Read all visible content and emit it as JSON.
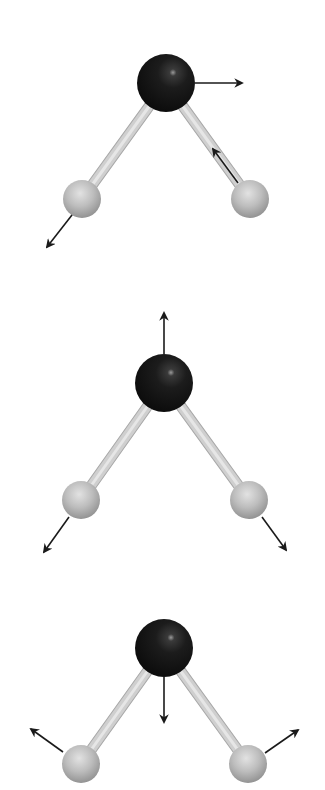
{
  "diagram": {
    "type": "molecular-vibrational-modes",
    "molecule": "bent triatomic (central heavy atom with two light atoms)",
    "colors": {
      "background": "#ffffff",
      "central_atom": "#1a1a1a",
      "outer_atom": "#b4b4b4",
      "bond": "#c8c8c8",
      "arrow": "#1a1a1a"
    },
    "modes": [
      {
        "name": "asymmetric-stretch",
        "central": {
          "cx": 166,
          "cy": 83,
          "r": 29
        },
        "left": {
          "cx": 82,
          "cy": 199,
          "r": 19
        },
        "right": {
          "cx": 250,
          "cy": 199,
          "r": 19
        },
        "arrows": [
          {
            "from": [
              195,
              83
            ],
            "to": [
              242,
              83
            ]
          },
          {
            "from": [
              72,
              215
            ],
            "to": [
              47,
              247
            ]
          },
          {
            "from": [
              238,
              183
            ],
            "to": [
              213,
              149
            ]
          }
        ]
      },
      {
        "name": "symmetric-stretch",
        "central": {
          "cx": 164,
          "cy": 383,
          "r": 29
        },
        "left": {
          "cx": 81,
          "cy": 500,
          "r": 19
        },
        "right": {
          "cx": 249,
          "cy": 500,
          "r": 19
        },
        "arrows": [
          {
            "from": [
              164,
              354
            ],
            "to": [
              164,
              313
            ]
          },
          {
            "from": [
              69,
              517
            ],
            "to": [
              44,
              552
            ]
          },
          {
            "from": [
              262,
              517
            ],
            "to": [
              286,
              550
            ]
          }
        ]
      },
      {
        "name": "bending",
        "central": {
          "cx": 164,
          "cy": 648,
          "r": 29
        },
        "left": {
          "cx": 81,
          "cy": 764,
          "r": 19
        },
        "right": {
          "cx": 248,
          "cy": 764,
          "r": 19
        },
        "arrows": [
          {
            "from": [
              164,
              677
            ],
            "to": [
              164,
              722
            ]
          },
          {
            "from": [
              63,
              752
            ],
            "to": [
              31,
              729
            ]
          },
          {
            "from": [
              265,
              753
            ],
            "to": [
              298,
              730
            ]
          }
        ]
      }
    ]
  }
}
